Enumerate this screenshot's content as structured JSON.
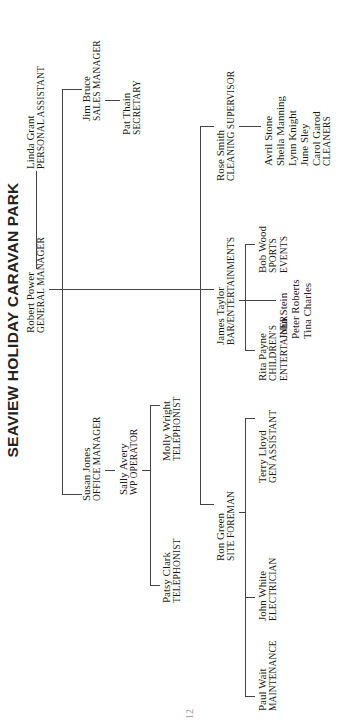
{
  "title": "SEAVIEW HOLIDAY CARAVAN PARK",
  "page_number": "12",
  "nodes": {
    "general_manager": {
      "name": "Robert Power",
      "role": "GENERAL MANAGER"
    },
    "personal_assistant": {
      "name": "Linda Grant",
      "role": "PERSONAL ASSISTANT"
    },
    "sales_manager": {
      "name": "Jim Bruce",
      "role": "SALES MANAGER"
    },
    "secretary": {
      "name": "Pat Thain",
      "role": "SECRETARY"
    },
    "cleaning_supervisor": {
      "name": "Rose Smith",
      "role": "CLEANING SUPERVISOR"
    },
    "cleaners": {
      "members": [
        "Avril Stone",
        "Sheila Manning",
        "Lynn Knight",
        "June Sley",
        "Carol Garod"
      ],
      "role": "CLEANERS"
    },
    "bar_entertainments": {
      "name": "James Taylor",
      "role": "BAR/ENTERTAINMENTS"
    },
    "sports_events": {
      "name": "Bob Wood",
      "role": "SPORTS",
      "role2": "EVENTS"
    },
    "childrens_entertainer": {
      "name": "Rita Payne",
      "role": "CHILDREN'S",
      "role2": "ENTERTAINER"
    },
    "bar_staff": {
      "members": [
        "John Stein",
        "Peter Roberts",
        "Tina Charles"
      ]
    },
    "site_foreman": {
      "name": "Ron Green",
      "role": "SITE FOREMAN"
    },
    "gen_assistant": {
      "name": "Terry Lloyd",
      "role": "GEN ASSISTANT"
    },
    "electrician": {
      "name": "John White",
      "role": "ELECTRICIAN"
    },
    "maintenance": {
      "name": "Paul Wait",
      "role": "MAINTENANCE"
    },
    "office_manager": {
      "name": "Susan Jones",
      "role": "OFFICE MANAGER"
    },
    "wp_operator": {
      "name": "Sally Avery",
      "role": "WP OPERATOR"
    },
    "telephonist_1": {
      "name": "Molly Wright",
      "role": "TELEPHONIST"
    },
    "telephonist_2": {
      "name": "Patsy Clark",
      "role": "TELEPHONIST"
    }
  }
}
